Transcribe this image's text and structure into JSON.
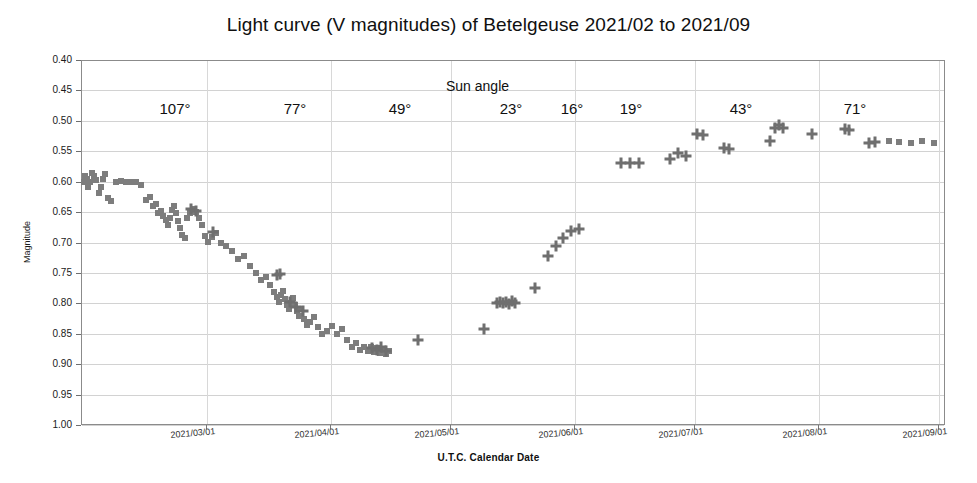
{
  "chart_data": {
    "type": "scatter",
    "title": "Light curve (V magnitudes) of Betelgeuse 2021/02 to 2021/09",
    "xlabel": "U.T.C. Calendar Date",
    "ylabel": "Magnitude",
    "grid": true,
    "legend": "none",
    "y_inverted": true,
    "ylim": [
      0.4,
      1.0
    ],
    "yticks": [
      "0.40",
      "0.45",
      "0.50",
      "0.55",
      "0.60",
      "0.65",
      "0.70",
      "0.75",
      "0.80",
      "0.85",
      "0.90",
      "0.95",
      "1.00"
    ],
    "ytick_values": [
      0.4,
      0.45,
      0.5,
      0.55,
      0.6,
      0.65,
      0.7,
      0.75,
      0.8,
      0.85,
      0.9,
      0.95,
      1.0
    ],
    "xlim": [
      "2021/02/09",
      "2021/09/21"
    ],
    "xticks": [
      "2021/03/01",
      "2021/04/01",
      "2021/05/01",
      "2021/06/01",
      "2021/07/01",
      "2021/08/01",
      "2021/09/01"
    ],
    "xtick_px": [
      206,
      330,
      450,
      574,
      694,
      818,
      938
    ],
    "annotations": {
      "caption": "Sun angle",
      "caption_px": [
        446,
        78
      ],
      "values": [
        "107°",
        "77°",
        "49°",
        "23°",
        "16°",
        "19°",
        "43°",
        "71°"
      ],
      "values_px_x": [
        175,
        295,
        400,
        511,
        572,
        631,
        741,
        855
      ],
      "values_px_y": 100
    },
    "series": [
      {
        "name": "squares",
        "marker": "square",
        "color": "#7d7d7d",
        "points": [
          [
            84,
            0.601
          ],
          [
            85,
            0.59
          ],
          [
            87,
            0.595
          ],
          [
            88,
            0.609
          ],
          [
            90,
            0.6
          ],
          [
            92,
            0.585
          ],
          [
            94,
            0.591
          ],
          [
            96,
            0.597
          ],
          [
            99,
            0.618
          ],
          [
            101,
            0.609
          ],
          [
            103,
            0.595
          ],
          [
            105,
            0.587
          ],
          [
            108,
            0.627
          ],
          [
            111,
            0.631
          ],
          [
            116,
            0.6
          ],
          [
            121,
            0.599
          ],
          [
            126,
            0.6
          ],
          [
            131,
            0.6
          ],
          [
            136,
            0.601
          ],
          [
            141,
            0.605
          ],
          [
            146,
            0.63
          ],
          [
            150,
            0.626
          ],
          [
            153,
            0.64
          ],
          [
            156,
            0.636
          ],
          [
            158,
            0.651
          ],
          [
            161,
            0.648
          ],
          [
            163,
            0.657
          ],
          [
            166,
            0.663
          ],
          [
            168,
            0.671
          ],
          [
            170,
            0.659
          ],
          [
            172,
            0.646
          ],
          [
            174,
            0.64
          ],
          [
            176,
            0.651
          ],
          [
            178,
            0.664
          ],
          [
            180,
            0.676
          ],
          [
            182,
            0.688
          ],
          [
            185,
            0.693
          ],
          [
            187,
            0.66
          ],
          [
            190,
            0.651
          ],
          [
            193,
            0.645
          ],
          [
            196,
            0.65
          ],
          [
            199,
            0.659
          ],
          [
            202,
            0.672
          ],
          [
            205,
            0.69
          ],
          [
            208,
            0.699
          ],
          [
            212,
            0.691
          ],
          [
            216,
            0.684
          ],
          [
            221,
            0.7
          ],
          [
            226,
            0.706
          ],
          [
            232,
            0.714
          ],
          [
            238,
            0.727
          ],
          [
            244,
            0.722
          ],
          [
            250,
            0.739
          ],
          [
            256,
            0.75
          ],
          [
            261,
            0.762
          ],
          [
            266,
            0.757
          ],
          [
            270,
            0.77
          ],
          [
            274,
            0.782
          ],
          [
            277,
            0.79
          ],
          [
            279,
            0.798
          ],
          [
            281,
            0.787
          ],
          [
            283,
            0.779
          ],
          [
            285,
            0.793
          ],
          [
            287,
            0.802
          ],
          [
            289,
            0.809
          ],
          [
            291,
            0.8
          ],
          [
            293,
            0.791
          ],
          [
            295,
            0.803
          ],
          [
            297,
            0.812
          ],
          [
            299,
            0.82
          ],
          [
            301,
            0.81
          ],
          [
            304,
            0.825
          ],
          [
            307,
            0.836
          ],
          [
            310,
            0.83
          ],
          [
            314,
            0.822
          ],
          [
            318,
            0.839
          ],
          [
            322,
            0.851
          ],
          [
            327,
            0.845
          ],
          [
            332,
            0.838
          ],
          [
            337,
            0.851
          ],
          [
            342,
            0.843
          ],
          [
            347,
            0.861
          ],
          [
            352,
            0.872
          ],
          [
            356,
            0.866
          ],
          [
            360,
            0.877
          ],
          [
            364,
            0.871
          ],
          [
            368,
            0.879
          ],
          [
            371,
            0.872
          ],
          [
            374,
            0.88
          ],
          [
            377,
            0.874
          ],
          [
            380,
            0.881
          ],
          [
            383,
            0.877
          ],
          [
            386,
            0.883
          ],
          [
            389,
            0.878
          ],
          [
            889,
            0.533
          ],
          [
            899,
            0.534
          ],
          [
            911,
            0.537
          ],
          [
            922,
            0.533
          ],
          [
            934,
            0.536
          ]
        ]
      },
      {
        "name": "crosses",
        "marker": "cross",
        "color": "#6f6f6f",
        "points": [
          [
            191,
            0.645
          ],
          [
            196,
            0.648
          ],
          [
            213,
            0.682
          ],
          [
            277,
            0.754
          ],
          [
            280,
            0.751
          ],
          [
            290,
            0.797
          ],
          [
            296,
            0.806
          ],
          [
            303,
            0.812
          ],
          [
            372,
            0.874
          ],
          [
            377,
            0.876
          ],
          [
            381,
            0.872
          ],
          [
            386,
            0.878
          ],
          [
            418,
            0.861
          ],
          [
            484,
            0.842
          ],
          [
            497,
            0.8
          ],
          [
            500,
            0.798
          ],
          [
            503,
            0.799
          ],
          [
            506,
            0.797
          ],
          [
            509,
            0.801
          ],
          [
            512,
            0.796
          ],
          [
            515,
            0.799
          ],
          [
            535,
            0.775
          ],
          [
            548,
            0.723
          ],
          [
            556,
            0.706
          ],
          [
            563,
            0.692
          ],
          [
            571,
            0.681
          ],
          [
            579,
            0.678
          ],
          [
            621,
            0.57
          ],
          [
            630,
            0.569
          ],
          [
            639,
            0.57
          ],
          [
            670,
            0.562
          ],
          [
            678,
            0.553
          ],
          [
            686,
            0.558
          ],
          [
            697,
            0.521
          ],
          [
            703,
            0.524
          ],
          [
            724,
            0.545
          ],
          [
            729,
            0.547
          ],
          [
            770,
            0.533
          ],
          [
            775,
            0.511
          ],
          [
            779,
            0.507
          ],
          [
            783,
            0.512
          ],
          [
            812,
            0.521
          ],
          [
            845,
            0.513
          ],
          [
            849,
            0.515
          ],
          [
            869,
            0.537
          ],
          [
            875,
            0.534
          ]
        ]
      }
    ]
  }
}
